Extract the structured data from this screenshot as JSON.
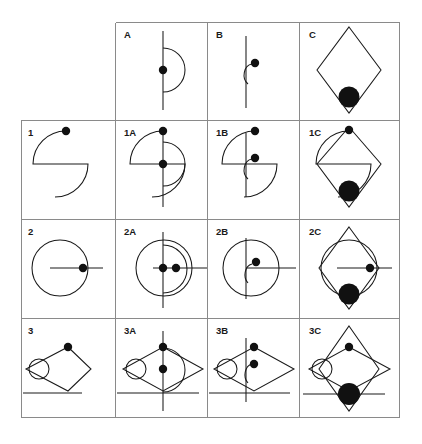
{
  "page": {
    "background_color": "#ffffff",
    "line_color": "#1a1a1a",
    "grid_color": "#8a8a8a",
    "dot_color": "#111111",
    "width": 422,
    "height": 444
  },
  "grid": {
    "columns": [
      "",
      "A",
      "B",
      "C"
    ],
    "rows": [
      "",
      "1",
      "2",
      "3"
    ],
    "col_x": [
      21,
      115,
      208,
      300,
      400
    ],
    "row_y": [
      22,
      120,
      219,
      318,
      418
    ]
  },
  "cells": [
    {
      "id": "A",
      "label": "A",
      "row": 0,
      "col": 1,
      "components": [
        "vertical-line",
        "right-semicircle",
        "center-dot"
      ]
    },
    {
      "id": "B",
      "label": "B",
      "row": 0,
      "col": 2,
      "components": [
        "vertical-line",
        "small-hook",
        "hook-dot"
      ]
    },
    {
      "id": "C",
      "label": "C",
      "row": 0,
      "col": 3,
      "components": [
        "tall-diamond",
        "large-filled-circle"
      ]
    },
    {
      "id": "1",
      "label": "1",
      "row": 1,
      "col": 0,
      "components": [
        "spiral-s-curve",
        "end-dot"
      ]
    },
    {
      "id": "1A",
      "label": "1A",
      "row": 1,
      "col": 1,
      "components": [
        "spiral-s-curve",
        "end-dot",
        "vertical-line",
        "right-semicircle",
        "center-dot"
      ]
    },
    {
      "id": "1B",
      "label": "1B",
      "row": 1,
      "col": 2,
      "components": [
        "spiral-s-curve",
        "end-dot",
        "vertical-line",
        "small-hook",
        "hook-dot"
      ]
    },
    {
      "id": "1C",
      "label": "1C",
      "row": 1,
      "col": 3,
      "components": [
        "spiral-s-curve",
        "tall-diamond",
        "large-filled-circle",
        "top-dot"
      ]
    },
    {
      "id": "2",
      "label": "2",
      "row": 2,
      "col": 0,
      "components": [
        "circle",
        "horizontal-line",
        "center-dot"
      ]
    },
    {
      "id": "2A",
      "label": "2A",
      "row": 2,
      "col": 1,
      "components": [
        "circle",
        "horizontal-line",
        "vertical-line",
        "right-semicircle",
        "center-dot",
        "offset-dot"
      ]
    },
    {
      "id": "2B",
      "label": "2B",
      "row": 2,
      "col": 2,
      "components": [
        "circle",
        "horizontal-line",
        "vertical-line",
        "small-hook",
        "hook-dot"
      ]
    },
    {
      "id": "2C",
      "label": "2C",
      "row": 2,
      "col": 3,
      "components": [
        "circle",
        "horizontal-line",
        "tall-diamond",
        "large-filled-circle",
        "center-dot"
      ]
    },
    {
      "id": "3",
      "label": "3",
      "row": 3,
      "col": 0,
      "components": [
        "wide-diamond",
        "small-circle-left",
        "top-dot",
        "bottom-horizontal-line"
      ]
    },
    {
      "id": "3A",
      "label": "3A",
      "row": 3,
      "col": 1,
      "components": [
        "wide-diamond",
        "small-circle-left",
        "bottom-horizontal-line",
        "vertical-line",
        "right-semicircle",
        "top-dot",
        "center-dot"
      ]
    },
    {
      "id": "3B",
      "label": "3B",
      "row": 3,
      "col": 2,
      "components": [
        "wide-diamond",
        "small-circle-left",
        "bottom-horizontal-line",
        "vertical-line",
        "small-hook",
        "top-dot",
        "hook-dot"
      ]
    },
    {
      "id": "3C",
      "label": "3C",
      "row": 3,
      "col": 3,
      "components": [
        "wide-diamond",
        "small-circle-left",
        "bottom-horizontal-line",
        "tall-diamond",
        "large-filled-circle",
        "top-dot"
      ]
    }
  ]
}
